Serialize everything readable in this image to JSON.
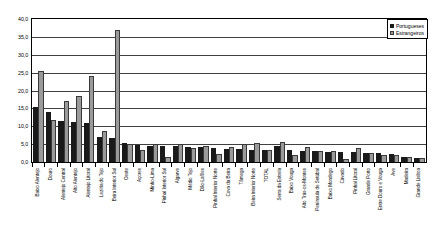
{
  "chart_data": {
    "type": "bar",
    "title": "",
    "xlabel": "",
    "ylabel": "",
    "ylim": [
      0.0,
      40.0
    ],
    "ytick_step": 5.0,
    "ytick_labels": [
      "40,0",
      "35,0",
      "30,0",
      "25,0",
      "20,0",
      "15,0",
      "10,0",
      "5,0",
      "0,0"
    ],
    "ytick_values": [
      40.0,
      35.0,
      30.0,
      25.0,
      20.0,
      15.0,
      10.0,
      5.0,
      0.0
    ],
    "grid": true,
    "grid_axis": "y",
    "legend_position": "upper-right",
    "orientation": "vertical",
    "grouping": "clustered",
    "categories": [
      "Baixo Alentejo",
      "Douro",
      "Alentejo Central",
      "Alto Alentejo",
      "Alentejo Litoral",
      "Lezíria do Tejo",
      "Beira Interior Sul",
      "Oeste",
      "Açores",
      "Minho-Lima",
      "Pinhal Interior Sul",
      "Algarve",
      "Médio Tejo",
      "Dão-Lafões",
      "Pinhal Interior Norte",
      "Cova da Beira",
      "Tâmega",
      "Beira Interior Norte",
      "TOTAL",
      "Serra da Estrela",
      "Baixo Vouga",
      "Alto Trás-os-Montes",
      "Península de Setúbal",
      "Baixo Mondego",
      "Cávado",
      "Pinhal Litoral",
      "Grande Porto",
      "Entre Douro e Vouga",
      "Ave",
      "Madeira",
      "Grande Lisboa"
    ],
    "series": [
      {
        "name": "Portugueses",
        "color": "#1a1a1a",
        "values": [
          15.4,
          14.1,
          11.6,
          11.3,
          10.9,
          7.0,
          6.8,
          5.2,
          4.7,
          4.6,
          4.4,
          4.5,
          4.3,
          4.2,
          3.9,
          3.7,
          3.6,
          3.5,
          3.4,
          4.6,
          3.4,
          3.2,
          3.1,
          2.9,
          2.8,
          2.7,
          2.6,
          2.4,
          2.2,
          1.3,
          1.2
        ]
      },
      {
        "name": "Estrangeiros",
        "color": "#9a9a9a",
        "values": [
          25.5,
          11.8,
          17.2,
          18.4,
          24.2,
          8.7,
          36.9,
          5.1,
          3.4,
          4.9,
          1.5,
          5.0,
          3.8,
          4.6,
          2.2,
          4.3,
          4.9,
          5.2,
          3.4,
          5.5,
          2.1,
          4.2,
          3.2,
          3.1,
          0.8,
          3.9,
          2.6,
          2.0,
          1.9,
          1.5,
          1.1
        ]
      }
    ]
  },
  "legend": {
    "entries": [
      {
        "label": "Portugueses"
      },
      {
        "label": "Estrangeiros"
      }
    ]
  }
}
